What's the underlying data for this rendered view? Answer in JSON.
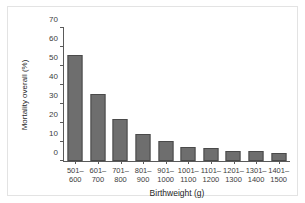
{
  "figure": {
    "background_color": "#ffffff",
    "panel_border_color": "#e3e3e3",
    "axis_color": "#5a5a5a",
    "bar_fill_color": "#6e6e6e",
    "bar_edge_color": "#4a4a4a"
  },
  "chart_data": {
    "type": "bar",
    "title": "",
    "xlabel": "Birthweight (g)",
    "ylabel": "Mortality overall (%)",
    "categories": [
      "501–\n600",
      "601–\n700",
      "701–\n800",
      "801–\n900",
      "901–\n1000",
      "1001–\n1100",
      "1101–\n1200",
      "1201–\n1300",
      "1301–\n1400",
      "1401–\n1500"
    ],
    "category_lines": [
      [
        "501–",
        "600"
      ],
      [
        "601–",
        "700"
      ],
      [
        "701–",
        "800"
      ],
      [
        "801–",
        "900"
      ],
      [
        "901–",
        "1000"
      ],
      [
        "1001–",
        "1100"
      ],
      [
        "1101–",
        "1200"
      ],
      [
        "1201–",
        "1300"
      ],
      [
        "1301–",
        "1400"
      ],
      [
        "1401–",
        "1500"
      ]
    ],
    "values": [
      56,
      35.5,
      22,
      14.3,
      10.3,
      7.2,
      7.0,
      5.4,
      5.2,
      4.1
    ],
    "ylim": [
      0,
      70
    ],
    "yticks": [
      0,
      10,
      20,
      30,
      40,
      50,
      60,
      70
    ],
    "ytick_labels": [
      "0",
      "10",
      "20",
      "30",
      "40",
      "50",
      "60",
      "70"
    ],
    "grid": false,
    "legend": null,
    "legend_position": "none"
  }
}
